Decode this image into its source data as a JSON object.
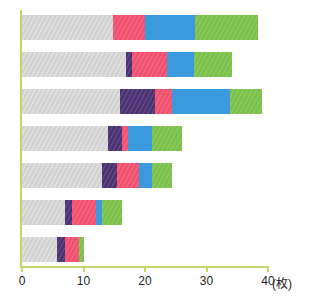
{
  "chart_data": {
    "type": "bar",
    "orientation": "horizontal",
    "stacked": true,
    "title": "",
    "subtitle": "",
    "xlabel": "",
    "ylabel": "",
    "unit_label": "(枚)",
    "xlim": [
      0,
      40
    ],
    "xticks": [
      0,
      10,
      20,
      30,
      40
    ],
    "xtick_labels": [
      "0",
      "10",
      "20",
      "30",
      "40"
    ],
    "grid": false,
    "legend": "none",
    "categories": [
      "1",
      "2",
      "3",
      "4",
      "5",
      "6",
      "7"
    ],
    "series": [
      {
        "name": "series-gray",
        "color": "#d3d3d3",
        "values": [
          14.8,
          16.9,
          15.9,
          14.0,
          13.0,
          7.0,
          5.7
        ]
      },
      {
        "name": "series-purple",
        "color": "#4a3272",
        "values": [
          0.0,
          1.0,
          5.7,
          2.3,
          2.4,
          1.1,
          1.3
        ]
      },
      {
        "name": "series-pink",
        "color": "#f0516f",
        "values": [
          5.2,
          5.7,
          2.8,
          1.0,
          3.7,
          3.9,
          2.3
        ]
      },
      {
        "name": "series-blue",
        "color": "#3b9ade",
        "values": [
          8.1,
          4.4,
          9.4,
          3.9,
          2.0,
          1.0,
          0.0
        ]
      },
      {
        "name": "series-green",
        "color": "#7cc24a",
        "values": [
          10.2,
          6.2,
          5.2,
          4.9,
          3.3,
          3.3,
          0.8
        ]
      }
    ],
    "totals": [
      38.3,
      34.2,
      39.0,
      26.1,
      24.4,
      16.3,
      10.1
    ]
  },
  "style": {
    "axis_color": "#c3d766",
    "tick_label_color": "#231f20",
    "background": "#ffffff"
  }
}
